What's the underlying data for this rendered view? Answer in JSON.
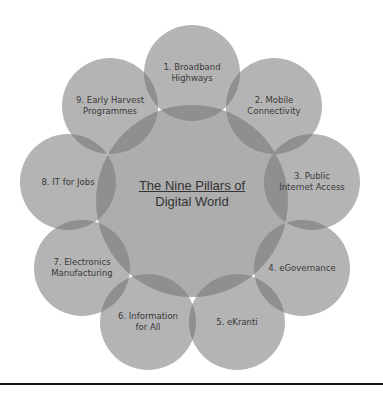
{
  "diagram": {
    "title_line1": "The Nine Pillars of",
    "title_line2": "Digital World",
    "center": {
      "x": 192,
      "y": 201,
      "r": 96
    },
    "outer_radius": 48,
    "colors": {
      "circle_fill": "#b4b4b4",
      "center_fill": "#adadad",
      "overlap_fill": "#8f8f8f",
      "text": "#3a3a3a",
      "rule": "#111111"
    },
    "pillars": [
      {
        "label_line1": "1. Broadband",
        "label_line2": "Highways",
        "x": 192,
        "y": 73
      },
      {
        "label_line1": "2. Mobile",
        "label_line2": "Connectivity",
        "x": 274,
        "y": 106
      },
      {
        "label_line1": "3. Public",
        "label_line2": "Internet Access",
        "x": 312,
        "y": 182
      },
      {
        "label_line1": "4. eGovernance",
        "label_line2": "",
        "x": 302,
        "y": 268
      },
      {
        "label_line1": "5. eKranti",
        "label_line2": "",
        "x": 237,
        "y": 322
      },
      {
        "label_line1": "6. Information",
        "label_line2": "for All",
        "x": 148,
        "y": 322
      },
      {
        "label_line1": "7. Electronics",
        "label_line2": "Manufacturing",
        "x": 82,
        "y": 268
      },
      {
        "label_line1": "8. IT for Jobs",
        "label_line2": "",
        "x": 68,
        "y": 182
      },
      {
        "label_line1": "9. Early Harvest",
        "label_line2": "Programmes",
        "x": 110,
        "y": 106
      }
    ]
  }
}
